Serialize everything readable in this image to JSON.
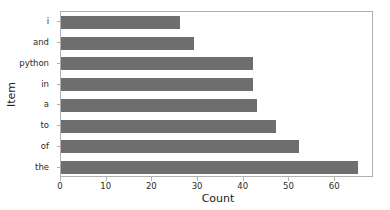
{
  "chart_data": {
    "type": "bar",
    "orientation": "horizontal",
    "title": "",
    "xlabel": "Count",
    "ylabel": "Item",
    "categories": [
      "i",
      "and",
      "python",
      "in",
      "a",
      "to",
      "of",
      "the"
    ],
    "values": [
      26,
      29,
      42,
      42,
      43,
      47,
      52,
      65
    ],
    "xlim": [
      0,
      68.5
    ],
    "xticks": [
      0,
      10,
      20,
      30,
      40,
      50,
      60
    ],
    "xticklabels": [
      "0",
      "10",
      "20",
      "30",
      "40",
      "50",
      "60"
    ],
    "yticklabels": [
      "i",
      "and",
      "python",
      "in",
      "a",
      "to",
      "of",
      "the"
    ],
    "grid": false,
    "legend": null,
    "bar_color": "#6e6e6e",
    "axes_color": "#b0b0b0",
    "background": "#ffffff"
  }
}
